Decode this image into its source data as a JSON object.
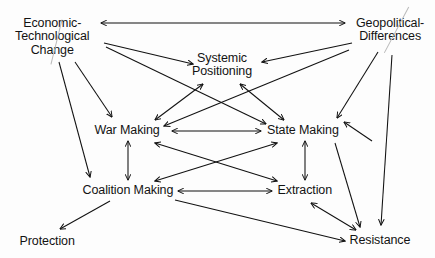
{
  "diagram": {
    "type": "directed-graph",
    "background_color": "#fdfdfd",
    "line_color": "#111111",
    "text_color": "#131313",
    "scratch_color": "#b9b9b9",
    "nodes": [
      {
        "id": "economic-technological-change",
        "label": "Economic-\nTechnological\nChange",
        "x": 52,
        "y": 37,
        "align": "center",
        "scratched": true
      },
      {
        "id": "geopolitical-differences",
        "label": "Geopolitical-\nDifferences",
        "x": 390,
        "y": 30,
        "align": "center",
        "scratched": true
      },
      {
        "id": "systemic-positioning",
        "label": "Systemic\nPositioning",
        "x": 222,
        "y": 65,
        "align": "center",
        "scratched": false
      },
      {
        "id": "war-making",
        "label": "War Making",
        "x": 127,
        "y": 131,
        "align": "center",
        "scratched": false
      },
      {
        "id": "state-making",
        "label": "State Making",
        "x": 303,
        "y": 131,
        "align": "center",
        "scratched": false
      },
      {
        "id": "coalition-making",
        "label": "Coalition Making",
        "x": 128,
        "y": 191,
        "align": "center",
        "scratched": false
      },
      {
        "id": "extraction",
        "label": "Extraction",
        "x": 305,
        "y": 191,
        "align": "center",
        "scratched": false
      },
      {
        "id": "protection",
        "label": "Protection",
        "x": 47,
        "y": 242,
        "align": "center",
        "scratched": false
      },
      {
        "id": "resistance",
        "label": "Resistance",
        "x": 380,
        "y": 241,
        "align": "center",
        "scratched": false
      }
    ],
    "edges": [
      {
        "from": "economic-technological-change",
        "to": "geopolitical-differences",
        "direction": "both",
        "x1": 101,
        "y1": 23,
        "x2": 345,
        "y2": 23
      },
      {
        "from": "economic-technological-change",
        "to": "systemic-positioning",
        "direction": "forward",
        "x1": 104,
        "y1": 43,
        "x2": 193,
        "y2": 64
      },
      {
        "from": "geopolitical-differences",
        "to": "systemic-positioning",
        "direction": "forward",
        "x1": 352,
        "y1": 43,
        "x2": 262,
        "y2": 62
      },
      {
        "from": "economic-technological-change",
        "to": "war-making",
        "direction": "forward",
        "x1": 75,
        "y1": 62,
        "x2": 112,
        "y2": 117
      },
      {
        "from": "economic-technological-change",
        "to": "coalition-making",
        "direction": "forward",
        "x1": 59,
        "y1": 62,
        "x2": 90,
        "y2": 177
      },
      {
        "from": "economic-technological-change",
        "to": "state-making",
        "direction": "forward",
        "x1": 106,
        "y1": 47,
        "x2": 266,
        "y2": 124
      },
      {
        "from": "geopolitical-differences",
        "to": "war-making",
        "direction": "forward",
        "x1": 349,
        "y1": 50,
        "x2": 164,
        "y2": 126
      },
      {
        "from": "geopolitical-differences",
        "to": "state-making",
        "direction": "forward",
        "x1": 378,
        "y1": 52,
        "x2": 337,
        "y2": 118
      },
      {
        "from": "geopolitical-differences",
        "to": "resistance",
        "direction": "forward",
        "x1": 392,
        "y1": 55,
        "x2": 381,
        "y2": 225
      },
      {
        "from": "systemic-positioning",
        "to": "war-making",
        "direction": "both",
        "x1": 203,
        "y1": 84,
        "x2": 155,
        "y2": 120
      },
      {
        "from": "systemic-positioning",
        "to": "state-making",
        "direction": "both",
        "x1": 240,
        "y1": 84,
        "x2": 284,
        "y2": 120
      },
      {
        "from": "war-making",
        "to": "state-making",
        "direction": "both",
        "x1": 172,
        "y1": 131,
        "x2": 261,
        "y2": 131
      },
      {
        "from": "war-making",
        "to": "coalition-making",
        "direction": "both",
        "x1": 128,
        "y1": 141,
        "x2": 128,
        "y2": 180
      },
      {
        "from": "state-making",
        "to": "extraction",
        "direction": "both",
        "x1": 305,
        "y1": 141,
        "x2": 305,
        "y2": 180
      },
      {
        "from": "war-making",
        "to": "extraction",
        "direction": "both",
        "x1": 155,
        "y1": 143,
        "x2": 277,
        "y2": 181
      },
      {
        "from": "state-making",
        "to": "coalition-making",
        "direction": "both",
        "x1": 277,
        "y1": 143,
        "x2": 155,
        "y2": 181
      },
      {
        "from": "coalition-making",
        "to": "extraction",
        "direction": "both",
        "x1": 178,
        "y1": 191,
        "x2": 272,
        "y2": 191
      },
      {
        "from": "coalition-making",
        "to": "protection",
        "direction": "forward",
        "x1": 110,
        "y1": 201,
        "x2": 60,
        "y2": 229
      },
      {
        "from": "coalition-making",
        "to": "resistance",
        "direction": "forward",
        "x1": 175,
        "y1": 200,
        "x2": 345,
        "y2": 241
      },
      {
        "from": "extraction",
        "to": "resistance",
        "direction": "both",
        "x1": 311,
        "y1": 203,
        "x2": 356,
        "y2": 230
      },
      {
        "from": "state-making",
        "to": "resistance",
        "direction": "forward",
        "x1": 335,
        "y1": 143,
        "x2": 360,
        "y2": 227
      },
      {
        "from": "resistance",
        "to": "state-making",
        "direction": "forward",
        "x1": 372,
        "y1": 141,
        "x2": 344,
        "y2": 122
      }
    ],
    "scratch_marks": [
      {
        "id": "scratch-economic",
        "x": 56,
        "y": 42,
        "length": 46,
        "angle": 76
      },
      {
        "id": "scratch-geo",
        "x": 396,
        "y": 30,
        "length": 52,
        "angle": 62
      }
    ]
  }
}
